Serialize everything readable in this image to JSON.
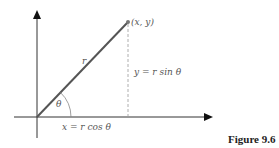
{
  "diagram": {
    "point_label": "(x, y)",
    "radius_label": "r",
    "angle_label": "θ",
    "y_label": "y = r sin θ",
    "x_label": "x = r cos θ",
    "caption": "Figure 9.6",
    "colors": {
      "axes": "#222222",
      "radius_line": "#555555",
      "point": "#777777",
      "dashed": "#999999",
      "text": "#555555"
    }
  }
}
